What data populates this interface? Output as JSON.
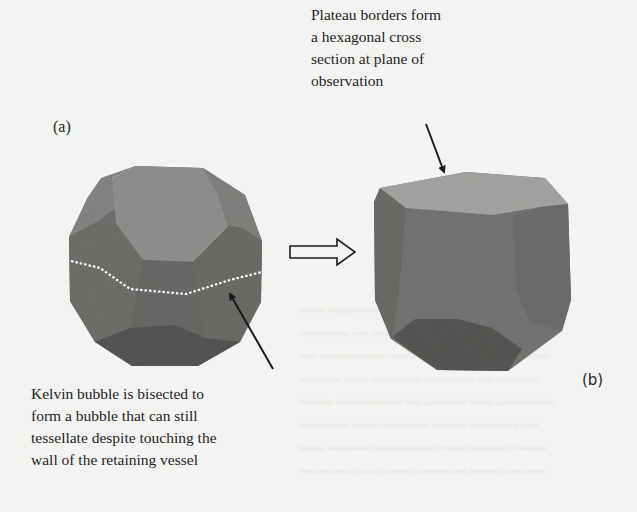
{
  "figure": {
    "panels": [
      {
        "id": "a",
        "label": "(a)",
        "shape": "Kelvin bubble (truncated octahedron)",
        "annotation": {
          "lines": [
            "Kelvin bubble is bisected to",
            "form a bubble that can still",
            "tessellate despite touching the",
            "wall of the retaining vessel"
          ]
        },
        "bisect_line": "white dotted line"
      },
      {
        "id": "b",
        "label": "(b)",
        "shape": "Bisected Kelvin bubble",
        "annotation": {
          "lines": [
            "Plateau borders form",
            "a hexagonal cross",
            "section at plane of",
            "observation"
          ]
        }
      }
    ],
    "transition_arrow": "hollow right arrow",
    "colors": {
      "background": "#f3f3f1",
      "face_light": "#8e8e8c",
      "face_mid": "#737371",
      "face_dark": "#5e5e5c",
      "face_darkest": "#4f4f4d",
      "top_face_b": "#a3a3a1",
      "arrow": "#1a1a1a",
      "dotted_line": "#ffffff"
    }
  }
}
